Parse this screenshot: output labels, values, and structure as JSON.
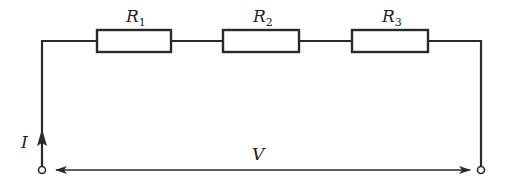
{
  "diagram": {
    "type": "series-circuit",
    "colors": {
      "stroke": "#2a2a2a",
      "background": "#ffffff"
    },
    "resistors": [
      {
        "label": "R",
        "subscript": "1"
      },
      {
        "label": "R",
        "subscript": "2"
      },
      {
        "label": "R",
        "subscript": "3"
      }
    ],
    "current_label": "I",
    "voltage_label": "V"
  }
}
